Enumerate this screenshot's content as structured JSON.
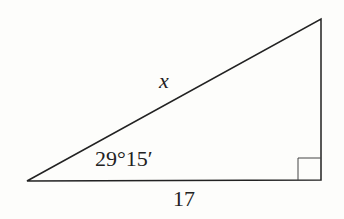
{
  "diagram": {
    "type": "right-triangle",
    "labels": {
      "hypotenuse": "x",
      "angle": "29°15′",
      "adjacent": "17"
    },
    "right_angle_marker": true,
    "stroke_color": "#222222"
  }
}
